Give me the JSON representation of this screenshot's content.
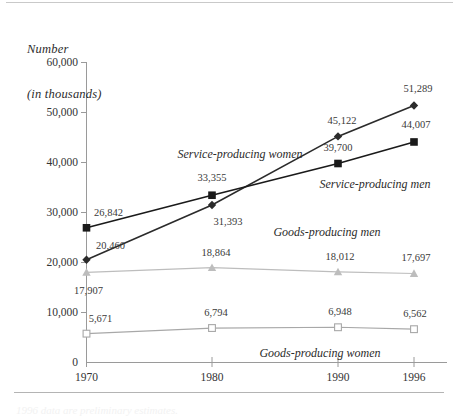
{
  "figure": {
    "axis_title_line1": "Number",
    "axis_title_line2": "(in thousands)",
    "footer_note": "1996 data are preliminary estimates."
  },
  "chart_data": {
    "type": "line",
    "title": "",
    "subtitle": "",
    "xlabel": "",
    "ylabel": "Number (in thousands)",
    "categories": [
      "1970",
      "1980",
      "1990",
      "1996"
    ],
    "x_tick_labels": [
      "1970",
      "1980",
      "1990",
      "1996"
    ],
    "y_tick_labels": [
      "0",
      "10,000",
      "20,000",
      "30,000",
      "40,000",
      "50,000",
      "60,000"
    ],
    "y_tick_values": [
      0,
      10000,
      20000,
      30000,
      40000,
      50000,
      60000
    ],
    "ylim": [
      0,
      60000
    ],
    "grid": false,
    "legend_position": "inline-annotations",
    "series": [
      {
        "name": "Service-producing women",
        "label": "Service-producing women",
        "marker": "diamond-filled",
        "color": "#2b2b2b",
        "values": [
          20460,
          31393,
          45122,
          51289
        ],
        "value_labels": [
          "20,460",
          "31,393",
          "45,122",
          "51,289"
        ]
      },
      {
        "name": "Service-producing men",
        "label": "Service-producing men",
        "marker": "square-filled",
        "color": "#1a1a1a",
        "values": [
          26842,
          33355,
          39700,
          44007
        ],
        "value_labels": [
          "26,842",
          "33,355",
          "39,700",
          "44,007"
        ]
      },
      {
        "name": "Goods-producing men",
        "label": "Goods-producing men",
        "marker": "triangle-filled",
        "color": "#bdbdbd",
        "values": [
          17907,
          18864,
          18012,
          17697
        ],
        "value_labels": [
          "17,907",
          "18,864",
          "18,012",
          "17,697"
        ]
      },
      {
        "name": "Goods-producing women",
        "label": "Goods-producing women",
        "marker": "square-open",
        "color": "#a8a8a8",
        "values": [
          5671,
          6794,
          6948,
          6562
        ],
        "value_labels": [
          "5,671",
          "6,794",
          "6,948",
          "6,562"
        ]
      }
    ]
  }
}
